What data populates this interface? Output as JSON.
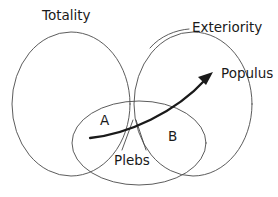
{
  "diagram": {
    "title_present": false,
    "background_color": "#ffffff",
    "line_color": "#4a4a4a",
    "arrow_color": "#1a1a1a",
    "text_color": "#1a1a1a",
    "labels": {
      "totality": "Totality",
      "exteriority": "Exteriority",
      "populus": "Populus",
      "plebs": "Plebs",
      "region_a": "A",
      "region_b": "B"
    },
    "shapes": [
      {
        "name": "totality-ellipse",
        "kind": "ellipse",
        "label": "Totality",
        "cx": 71,
        "cy": 104,
        "rx": 59,
        "ry": 72
      },
      {
        "name": "exteriority-ellipse",
        "kind": "ellipse",
        "label": "Exteriority",
        "cx": 193,
        "cy": 104,
        "rx": 59,
        "ry": 72
      },
      {
        "name": "populus-ellipse",
        "kind": "ellipse",
        "label": "Populus",
        "cx": 139,
        "cy": 143,
        "rx": 67,
        "ry": 42
      }
    ],
    "arrow": {
      "name": "populus-arrow",
      "from_x": 90,
      "from_y": 138,
      "to_x": 213,
      "to_y": 73,
      "curved": true
    },
    "leaders": [
      {
        "name": "exteriority-leader",
        "target": "Exteriority"
      },
      {
        "name": "plebs-leader-left",
        "target": "Plebs"
      },
      {
        "name": "plebs-leader-right",
        "target": "Plebs"
      }
    ]
  }
}
